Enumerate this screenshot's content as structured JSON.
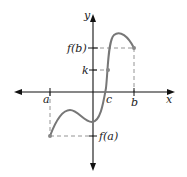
{
  "diagram": {
    "axes": {
      "x_label": "x",
      "y_label": "y"
    },
    "x_ticks": {
      "a": "a",
      "c": "c",
      "b": "b"
    },
    "y_ticks": {
      "fb": "f(b)",
      "k": "k",
      "fa": "f(a)"
    },
    "colors": {
      "axis": "#111111",
      "curve": "#777777",
      "dashed": "#888888",
      "point": "#888888"
    }
  }
}
